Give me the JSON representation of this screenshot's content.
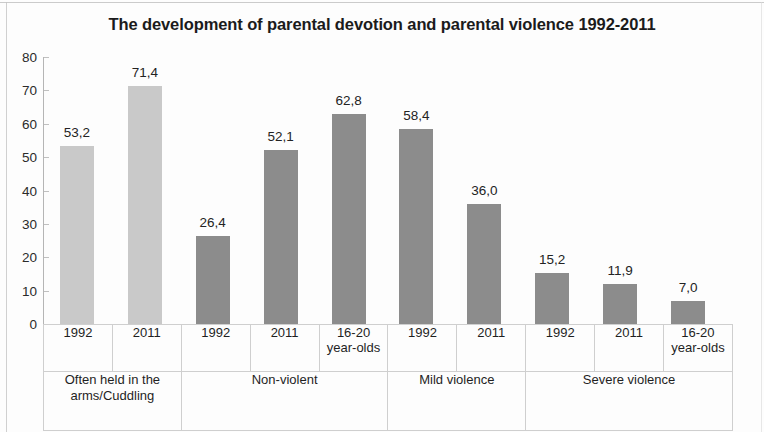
{
  "chart_data": {
    "type": "bar",
    "title": "The development of parental devotion and parental violence 1992-2011",
    "xlabel": "",
    "ylabel": "",
    "ylim": [
      0,
      80
    ],
    "yticks": [
      0,
      10,
      20,
      30,
      40,
      50,
      60,
      70,
      80
    ],
    "ytick_labels": [
      "0",
      "10",
      "20",
      "30",
      "40",
      "50",
      "60",
      "70",
      "80"
    ],
    "grid": false,
    "legend": "none",
    "decimal_separator": ",",
    "categories": [
      "1992",
      "2011",
      "1992",
      "2011",
      "16-20 year-olds",
      "1992",
      "2011",
      "1992",
      "2011",
      "16-20 year-olds"
    ],
    "values": [
      53.2,
      71.4,
      26.4,
      52.1,
      62.8,
      58.4,
      36.0,
      15.2,
      11.9,
      7.0
    ],
    "value_labels": [
      "53,2",
      "71,4",
      "26,4",
      "52,1",
      "62,8",
      "58,4",
      "36,0",
      "15,2",
      "11,9",
      "7,0"
    ],
    "bar_colors": [
      "#c9c9c9",
      "#c9c9c9",
      "#8c8c8c",
      "#8c8c8c",
      "#8c8c8c",
      "#8c8c8c",
      "#8c8c8c",
      "#8c8c8c",
      "#8c8c8c",
      "#8c8c8c"
    ],
    "groups": [
      {
        "label": "Often held in the arms/Cuddling",
        "span": 2
      },
      {
        "label": "Non-violent",
        "span": 3
      },
      {
        "label": "Mild violence",
        "span": 2
      },
      {
        "label": "Severe violence",
        "span": 3
      }
    ],
    "tick_labels_multiline": [
      [
        "1992"
      ],
      [
        "2011"
      ],
      [
        "1992"
      ],
      [
        "2011"
      ],
      [
        "16-20",
        "year-olds"
      ],
      [
        "1992"
      ],
      [
        "2011"
      ],
      [
        "1992"
      ],
      [
        "2011"
      ],
      [
        "16-20",
        "year-olds"
      ]
    ]
  }
}
